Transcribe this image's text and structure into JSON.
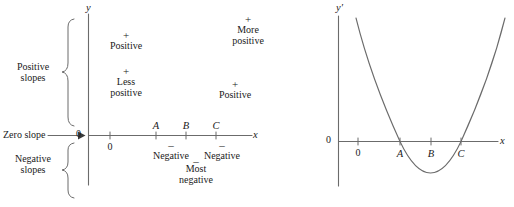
{
  "figure": {
    "type": "math-diagram",
    "stroke_color": "#6b6b6b",
    "text_color": "#1a1a1a"
  },
  "left_panel": {
    "name": "slope-sign-panel",
    "axes": {
      "y_label": "y",
      "x_label": "x",
      "origin_label": "0",
      "origin_tick_label": "0"
    },
    "side_labels": [
      {
        "key": "positive-slopes",
        "line1": "Positive",
        "line2": "slopes"
      },
      {
        "key": "zero-slope",
        "line1": "Zero slope",
        "line2": ""
      },
      {
        "key": "negative-slopes",
        "line1": "Negative",
        "line2": "slopes"
      }
    ],
    "points": [
      {
        "label": "A"
      },
      {
        "label": "B"
      },
      {
        "label": "C"
      }
    ],
    "above_axis_annotations": [
      {
        "sign": "+",
        "line1": "Positive",
        "line2": ""
      },
      {
        "sign": "+",
        "line1": "Less",
        "line2": "positive"
      },
      {
        "sign": "+",
        "line1": "More",
        "line2": "positive"
      },
      {
        "sign": "+",
        "line1": "Positive",
        "line2": ""
      }
    ],
    "below_axis_annotations": [
      {
        "sign": "–",
        "line1": "Negative",
        "line2": ""
      },
      {
        "sign": "–",
        "line1": "Negative",
        "line2": ""
      },
      {
        "sign": "–",
        "line1": "Most",
        "line2": "negative"
      }
    ]
  },
  "right_panel": {
    "name": "derivative-curve-panel",
    "axes": {
      "y_label": "y′",
      "x_label": "x",
      "origin_label": "0",
      "origin_tick_label": "0"
    },
    "points": [
      {
        "label": "A"
      },
      {
        "label": "B"
      },
      {
        "label": "C"
      }
    ],
    "curve": {
      "shape": "parabola",
      "opens": "up",
      "roots_at": [
        "A",
        "C"
      ],
      "vertex_at": "B"
    }
  }
}
